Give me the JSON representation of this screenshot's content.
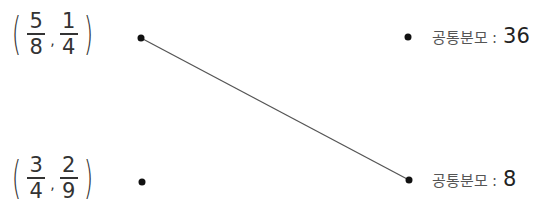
{
  "left_items": [
    {
      "fraction1": {
        "num": "5",
        "den": "8"
      },
      "fraction2": {
        "num": "1",
        "den": "4"
      }
    },
    {
      "fraction1": {
        "num": "3",
        "den": "4"
      },
      "fraction2": {
        "num": "2",
        "den": "9"
      }
    }
  ],
  "right_items": [
    {
      "label": "공통분모",
      "colon": ":",
      "value": "36"
    },
    {
      "label": "공통분모",
      "colon": ":",
      "value": "8"
    }
  ],
  "connections": [
    {
      "from": "left_items.0",
      "to": "right_items.1"
    }
  ],
  "colors": {
    "line": "#555555",
    "dot": "#111111",
    "text": "#333333"
  }
}
